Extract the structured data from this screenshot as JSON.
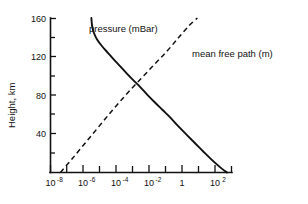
{
  "chart_data": {
    "type": "line",
    "title": "",
    "xlabel": "",
    "ylabel": "Height, km",
    "xscale": "log",
    "yscale": "linear",
    "xlim": [
      1e-08,
      1000.0
    ],
    "ylim": [
      0,
      160
    ],
    "grid": false,
    "legend": "inline-annotations",
    "x_tick_labels": [
      {
        "base": "10",
        "exp": "-8",
        "value": 1e-08
      },
      {
        "base": "10",
        "exp": "-6",
        "value": 1e-06
      },
      {
        "base": "10",
        "exp": "-4",
        "value": 0.0001
      },
      {
        "base": "10",
        "exp": "-2",
        "value": 0.01
      },
      {
        "base": "1",
        "exp": "",
        "value": 1
      },
      {
        "base": "10",
        "exp": "2",
        "value": 100
      }
    ],
    "x_minor_ticks": [
      1e-07,
      1e-05,
      0.001,
      0.1,
      10,
      1000
    ],
    "y_tick_labels": [
      {
        "label": "160",
        "value": 160
      },
      {
        "label": "120",
        "value": 120
      },
      {
        "label": "80",
        "value": 80
      },
      {
        "label": "40",
        "value": 40
      }
    ],
    "y_minor_ticks": [
      140,
      100,
      60,
      20
    ],
    "series": [
      {
        "name": "pressure (mBar)",
        "style": "solid",
        "label": "pressure  (mBar)",
        "points": [
          {
            "x": 3e-06,
            "y": 160
          },
          {
            "x": 3.3e-06,
            "y": 152
          },
          {
            "x": 4.2e-06,
            "y": 145
          },
          {
            "x": 6.5e-06,
            "y": 138
          },
          {
            "x": 1.3e-05,
            "y": 131
          },
          {
            "x": 3e-05,
            "y": 124
          },
          {
            "x": 7e-05,
            "y": 117
          },
          {
            "x": 0.00017,
            "y": 110
          },
          {
            "x": 0.0004,
            "y": 103
          },
          {
            "x": 0.001,
            "y": 96
          },
          {
            "x": 0.0026,
            "y": 89
          },
          {
            "x": 0.007,
            "y": 81
          },
          {
            "x": 0.02,
            "y": 73
          },
          {
            "x": 0.06,
            "y": 65
          },
          {
            "x": 0.18,
            "y": 57
          },
          {
            "x": 0.55,
            "y": 48
          },
          {
            "x": 1.8,
            "y": 39
          },
          {
            "x": 6.0,
            "y": 30
          },
          {
            "x": 20.0,
            "y": 21
          },
          {
            "x": 70.0,
            "y": 12
          },
          {
            "x": 240.0,
            "y": 4
          },
          {
            "x": 500.0,
            "y": 0
          }
        ]
      },
      {
        "name": "mean free path (m)",
        "style": "dashed",
        "label": "mean  free  path (m)",
        "points": [
          {
            "x": 4e-08,
            "y": 0
          },
          {
            "x": 2e-07,
            "y": 14
          },
          {
            "x": 1.2e-06,
            "y": 30
          },
          {
            "x": 8e-06,
            "y": 47
          },
          {
            "x": 6e-05,
            "y": 65
          },
          {
            "x": 0.0004,
            "y": 81
          },
          {
            "x": 0.003,
            "y": 97
          },
          {
            "x": 0.02,
            "y": 112
          },
          {
            "x": 0.12,
            "y": 126
          },
          {
            "x": 0.6,
            "y": 140
          },
          {
            "x": 2.5,
            "y": 152
          },
          {
            "x": 8.0,
            "y": 160
          }
        ]
      }
    ],
    "annotations": [
      {
        "text": "pressure  (mBar)",
        "series": "pressure (mBar)"
      },
      {
        "text": "mean  free  path (m)",
        "series": "mean free path (m)"
      }
    ]
  },
  "colors": {
    "ink": "#111111",
    "background": "#ffffff"
  }
}
